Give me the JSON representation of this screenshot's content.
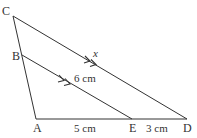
{
  "diagram": {
    "type": "geometry-triangle-parallel-lines",
    "stroke_color": "#333333",
    "background": "#ffffff",
    "points": {
      "A": {
        "label": "A",
        "x": 36,
        "y": 119
      },
      "B": {
        "label": "B",
        "x": 22,
        "y": 55
      },
      "C": {
        "label": "C",
        "x": 13,
        "y": 16
      },
      "D": {
        "label": "D",
        "x": 187,
        "y": 119
      },
      "E": {
        "label": "E",
        "x": 132,
        "y": 119
      }
    },
    "segments": [
      {
        "from": "C",
        "to": "A"
      },
      {
        "from": "A",
        "to": "D"
      },
      {
        "from": "C",
        "to": "D"
      },
      {
        "from": "B",
        "to": "E"
      }
    ],
    "labels": {
      "AE": "5 cm",
      "ED": "3 cm",
      "BE": "6 cm",
      "CD": "x"
    },
    "parallel_marks": "double-arrow on BE and CD"
  }
}
